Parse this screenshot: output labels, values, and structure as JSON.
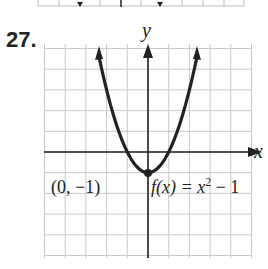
{
  "exercise": {
    "number": "27."
  },
  "chart_data": {
    "type": "line",
    "title": "",
    "function": "f(x) = x^2 - 1",
    "xlabel": "x",
    "ylabel": "y",
    "xlim": [
      -5,
      5
    ],
    "ylim": [
      -5,
      5
    ],
    "grid": true,
    "x": [
      -2.5,
      -2,
      -1.5,
      -1,
      -0.5,
      0,
      0.5,
      1,
      1.5,
      2,
      2.5
    ],
    "series": [
      {
        "name": "f(x) = x^2 - 1",
        "values": [
          5.25,
          3,
          1.25,
          0,
          -0.75,
          -1,
          -0.75,
          0,
          1.25,
          3,
          5.25
        ]
      }
    ],
    "annotations": [
      {
        "text": "(0, −1)",
        "point": [
          0,
          -1
        ]
      },
      {
        "text": "f(x) = x² − 1"
      }
    ]
  },
  "labels": {
    "x_axis": "x",
    "y_axis": "y",
    "vertex": "(0, −1)",
    "func_prefix": "f(x) = x",
    "func_exp": "2",
    "func_suffix": " − 1"
  }
}
